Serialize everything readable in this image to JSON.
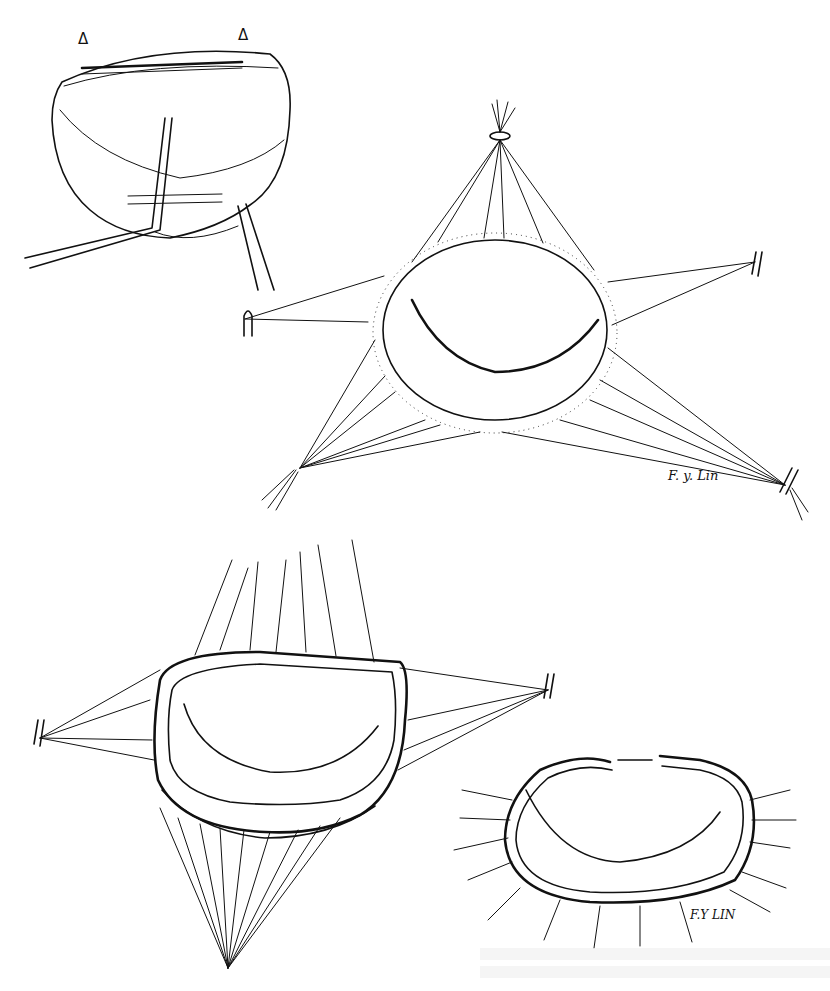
{
  "figure": {
    "type": "surgical illustration",
    "panels": [
      {
        "id": "panel-a",
        "description": "annulus with rigid ring held by forceps; two triangle markers above",
        "markers": [
          "Δ",
          "Δ"
        ]
      },
      {
        "id": "panel-b",
        "description": "valve with traction sutures radiating to five tied bundles",
        "signature": "F. y. Lin"
      },
      {
        "id": "panel-c",
        "description": "ring sutured into annulus with sutures fanned upward, left, right and downward"
      },
      {
        "id": "panel-d",
        "description": "completed annuloplasty ring with open gap and trimmed sutures",
        "signature": "F.Y LIN"
      }
    ]
  },
  "colors": {
    "ink": "#111111",
    "paper": "#ffffff",
    "bleedthrough": "#ececec"
  }
}
